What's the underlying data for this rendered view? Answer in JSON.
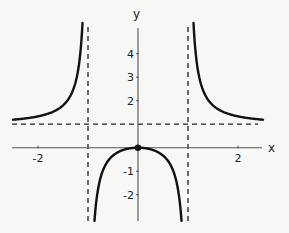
{
  "chart_data": {
    "type": "line",
    "title": "",
    "function": "f(x) = x^2 / (x^2 - 1)",
    "xlabel": "x",
    "ylabel": "y",
    "xlim": [
      -2.5,
      2.5
    ],
    "ylim": [
      -3.1,
      5.1
    ],
    "x_ticks": [
      {
        "value": -2,
        "label": "-2"
      },
      {
        "value": 2,
        "label": "2"
      }
    ],
    "y_ticks": [
      {
        "value": 4,
        "label": "4"
      },
      {
        "value": 3,
        "label": "3"
      },
      {
        "value": 2,
        "label": "2"
      },
      {
        "value": -1,
        "label": "-1"
      },
      {
        "value": -2,
        "label": "-2"
      }
    ],
    "grid": false,
    "legend": null,
    "asymptotes": {
      "vertical": [
        -1,
        1
      ],
      "horizontal": [
        1
      ]
    },
    "marked_points": [
      {
        "x": 0,
        "y": 0,
        "label": "local maximum"
      }
    ],
    "series": [
      {
        "name": "left-branch",
        "x_range": [
          -2.5,
          -1.11
        ],
        "x": [
          -2.5,
          -2.0,
          -1.5,
          -1.3,
          -1.2,
          -1.11
        ],
        "y": [
          1.19,
          1.33,
          1.8,
          2.45,
          3.27,
          5.03
        ]
      },
      {
        "name": "middle-branch",
        "x_range": [
          -0.87,
          0.87
        ],
        "x": [
          -0.87,
          -0.8,
          -0.6,
          -0.4,
          -0.2,
          0,
          0.2,
          0.4,
          0.6,
          0.8,
          0.87
        ],
        "y": [
          -3.1,
          -1.78,
          -0.56,
          -0.19,
          -0.04,
          0,
          -0.04,
          -0.19,
          -0.56,
          -1.78,
          -3.1
        ]
      },
      {
        "name": "right-branch",
        "x_range": [
          1.11,
          2.5
        ],
        "x": [
          1.11,
          1.2,
          1.3,
          1.5,
          2.0,
          2.5
        ],
        "y": [
          5.03,
          3.27,
          2.45,
          1.8,
          1.33,
          1.19
        ]
      }
    ]
  },
  "layout": {
    "origin_px": [
      138,
      147.7
    ],
    "x_unit_px": 50,
    "y_unit_px": 23.5,
    "x_axis_px": [
      12,
      262
    ],
    "y_axis_px": [
      28,
      221
    ],
    "colors": {
      "curve": "#111111",
      "axis": "#555555",
      "dash": "#222222"
    }
  }
}
